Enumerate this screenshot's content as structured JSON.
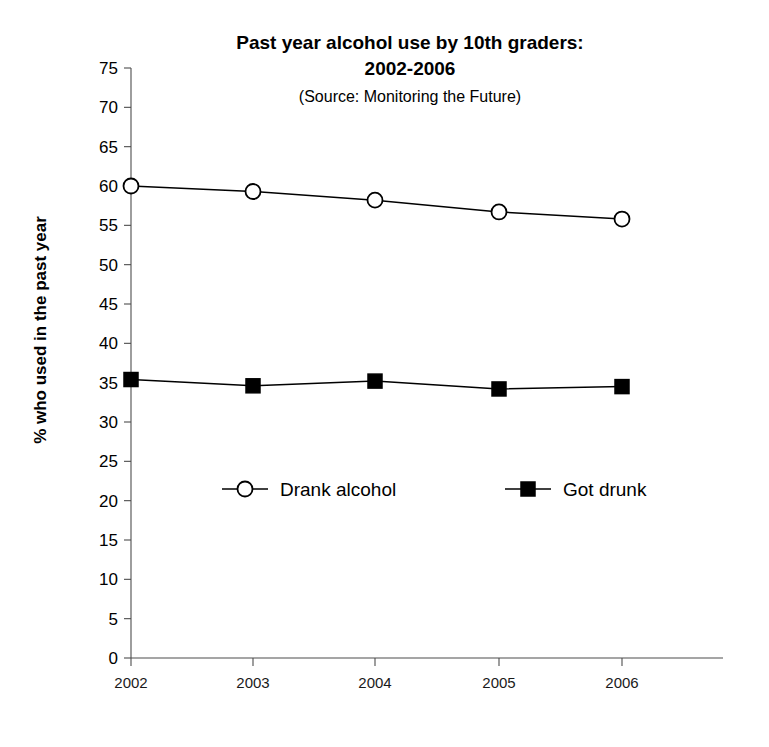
{
  "chart_data": {
    "type": "line",
    "title": "Past year alcohol use by 10th graders:",
    "title_line2": "2002-2006",
    "subtitle": "(Source: Monitoring the Future)",
    "xlabel": "",
    "ylabel": "% who used in the past year",
    "categories": [
      "2002",
      "2003",
      "2004",
      "2005",
      "2006"
    ],
    "x": [
      2002,
      2003,
      2004,
      2005,
      2006
    ],
    "ylim": [
      0,
      75
    ],
    "ytick_step": 5,
    "yticks": [
      0,
      5,
      10,
      15,
      20,
      25,
      30,
      35,
      40,
      45,
      50,
      55,
      60,
      65,
      70,
      75
    ],
    "ytick_labels": [
      "0",
      "5",
      "10",
      "15",
      "20",
      "25",
      "30",
      "35",
      "40",
      "45",
      "50",
      "55",
      "60",
      "65",
      "70",
      "75"
    ],
    "grid": false,
    "legend_position": "inside-center",
    "series": [
      {
        "name": "Drank alcohol",
        "marker": "open-circle",
        "color": "#000000",
        "values": [
          60.0,
          59.3,
          58.2,
          56.7,
          55.8
        ]
      },
      {
        "name": "Got drunk",
        "marker": "filled-square",
        "color": "#000000",
        "values": [
          35.4,
          34.6,
          35.2,
          34.2,
          34.5
        ]
      }
    ]
  },
  "legend": {
    "items": [
      {
        "label": "Drank alcohol",
        "marker": "open-circle"
      },
      {
        "label": "Got drunk",
        "marker": "filled-square"
      }
    ]
  }
}
